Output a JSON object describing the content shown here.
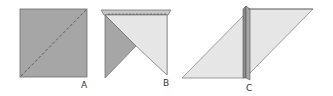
{
  "figure": {
    "colors": {
      "paper_front": "#a6a6a6",
      "paper_back": "#e6e6e6",
      "paper_mid": "#c8c8c8",
      "edge": "#555555",
      "fold_line": "#555555"
    },
    "steps": [
      {
        "id": "A",
        "label": "A"
      },
      {
        "id": "B",
        "label": "B"
      },
      {
        "id": "C",
        "label": "C"
      }
    ]
  }
}
